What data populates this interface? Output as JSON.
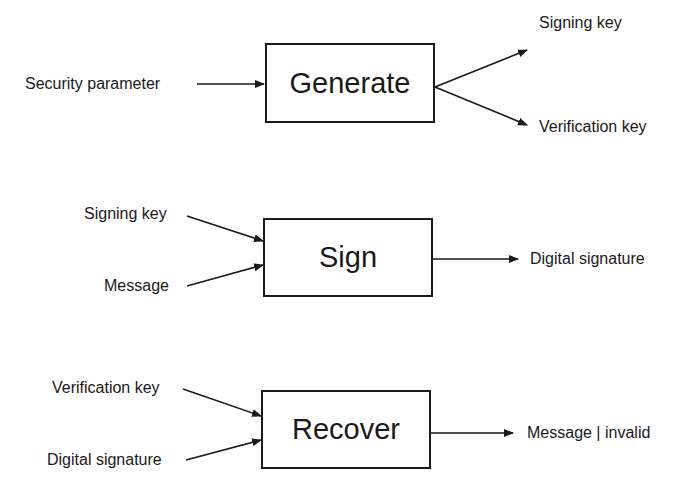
{
  "generate": {
    "title": "Generate",
    "input": "Security parameter",
    "outputs": [
      "Signing key",
      "Verification key"
    ]
  },
  "sign": {
    "title": "Sign",
    "inputs": [
      "Signing key",
      "Message"
    ],
    "output": "Digital signature"
  },
  "recover": {
    "title": "Recover",
    "inputs": [
      "Verification key",
      "Digital signature"
    ],
    "output": "Message | invalid"
  },
  "colors": {
    "stroke": "#1a1a1a",
    "background": "#ffffff"
  }
}
